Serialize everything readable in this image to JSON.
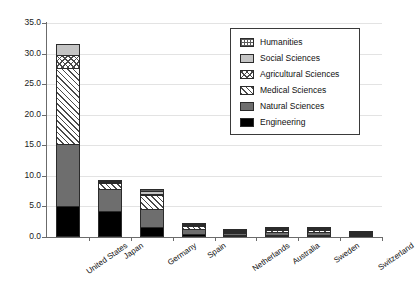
{
  "chart_data": {
    "type": "bar",
    "stacked": true,
    "title": "",
    "xlabel": "",
    "ylabel": "",
    "ylim": [
      0.0,
      35.0
    ],
    "ytick_labels": [
      "0.0",
      "5.0",
      "10.0",
      "15.0",
      "20.0",
      "25.0",
      "30.0",
      "35.0"
    ],
    "ytick_values": [
      0,
      5,
      10,
      15,
      20,
      25,
      30,
      35
    ],
    "grid": true,
    "legend_position": "upper right",
    "categories": [
      "United States",
      "Japan",
      "Germany",
      "Spain",
      "Netherlands",
      "Australia",
      "Sweden",
      "Switzerland"
    ],
    "series": [
      {
        "name": "Engineering",
        "pattern": "solid-black",
        "values": [
          5.0,
          4.3,
          1.7,
          0.5,
          0.2,
          0.2,
          0.2,
          0.1
        ]
      },
      {
        "name": "Natural Sciences",
        "pattern": "solid-darkgray",
        "values": [
          10.3,
          3.7,
          3.0,
          0.9,
          0.5,
          0.6,
          0.6,
          0.3
        ]
      },
      {
        "name": "Medical Sciences",
        "pattern": "diagonal-hatch",
        "values": [
          12.7,
          1.2,
          2.5,
          0.7,
          0.4,
          0.5,
          0.5,
          0.1
        ]
      },
      {
        "name": "Agricultural Sciences",
        "pattern": "cross-hatch",
        "values": [
          2.3,
          0.3,
          0.3,
          0.2,
          0.1,
          0.1,
          0.1,
          0.05
        ]
      },
      {
        "name": "Social Sciences",
        "pattern": "solid-lightgray",
        "values": [
          1.9,
          0.3,
          0.6,
          0.2,
          0.2,
          0.2,
          0.2,
          0.05
        ]
      },
      {
        "name": "Humanities",
        "pattern": "dotted-grid",
        "values": [
          0.0,
          0.2,
          0.5,
          0.2,
          0.2,
          0.2,
          0.2,
          0.0
        ]
      }
    ],
    "totals": [
      32.2,
      10.0,
      8.6,
      2.7,
      1.6,
      1.8,
      1.8,
      0.6
    ]
  },
  "legend": {
    "items": [
      {
        "label": "Humanities",
        "swatch": "dotted-grid"
      },
      {
        "label": "Social Sciences",
        "swatch": "solid-lightgray"
      },
      {
        "label": "Agricultural Sciences",
        "swatch": "cross-hatch"
      },
      {
        "label": "Medical Sciences",
        "swatch": "diagonal-hatch"
      },
      {
        "label": "Natural Sciences",
        "swatch": "solid-darkgray"
      },
      {
        "label": "Engineering",
        "swatch": "solid-black"
      }
    ]
  }
}
